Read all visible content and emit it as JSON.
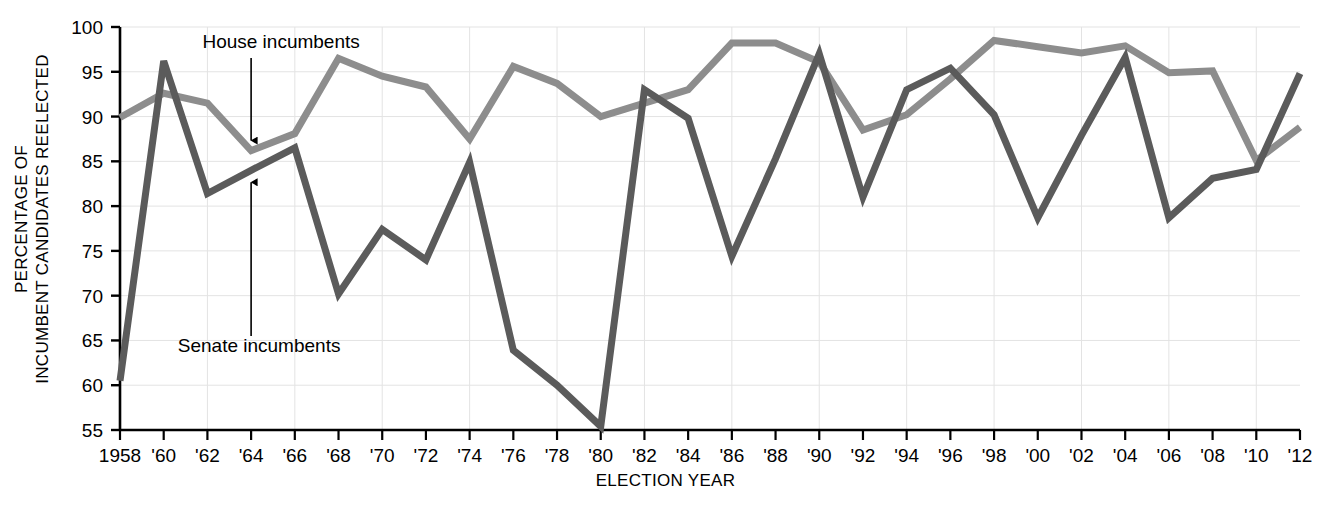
{
  "chart_data": {
    "type": "line",
    "title": "",
    "xlabel": "ELECTION YEAR",
    "ylabel": "PERCENTAGE OF\nINCUMBENT CANDIDATES REELECTED",
    "ylabel_line1": "PERCENTAGE OF",
    "ylabel_line2": "INCUMBENT CANDIDATES REELECTED",
    "xlim": [
      1958,
      2012
    ],
    "ylim": [
      55,
      100
    ],
    "yticks": [
      55,
      60,
      65,
      70,
      75,
      80,
      85,
      90,
      95,
      100
    ],
    "ytick_labels": [
      "55",
      "60",
      "65",
      "70",
      "75",
      "80",
      "85",
      "90",
      "95",
      "100"
    ],
    "grid": true,
    "grid_color": "#e3e3e3",
    "legend": "inline-annotations",
    "x": [
      1958,
      1960,
      1962,
      1964,
      1966,
      1968,
      1970,
      1972,
      1974,
      1976,
      1978,
      1980,
      1982,
      1984,
      1986,
      1988,
      1990,
      1992,
      1994,
      1996,
      1998,
      2000,
      2002,
      2004,
      2006,
      2008,
      2010,
      2012
    ],
    "xtick_labels": [
      "1958",
      "'60",
      "'62",
      "'64",
      "'66",
      "'68",
      "'70",
      "'72",
      "'74",
      "'76",
      "'78",
      "'80",
      "'82",
      "'84",
      "'86",
      "'88",
      "'90",
      "'92",
      "'94",
      "'96",
      "'98",
      "'00",
      "'02",
      "'04",
      "'06",
      "'08",
      "'10",
      "'12"
    ],
    "series": [
      {
        "name": "House incumbents",
        "color": "#8d8d8d",
        "values": [
          89.9,
          92.6,
          91.5,
          86.2,
          88.1,
          96.5,
          94.5,
          93.3,
          87.5,
          95.6,
          93.7,
          90.0,
          91.5,
          93.0,
          98.2,
          98.2,
          96.1,
          88.5,
          90.2,
          94.2,
          98.5,
          97.8,
          97.1,
          97.9,
          94.9,
          95.1,
          85.1,
          88.8
        ]
      },
      {
        "name": "Senate incumbents",
        "color": "#5b5b5b",
        "values": [
          60.5,
          96.2,
          81.4,
          84.0,
          86.5,
          70.2,
          77.4,
          74.0,
          84.9,
          63.9,
          60.0,
          55.4,
          93.0,
          89.8,
          74.4,
          85.3,
          97.0,
          81.0,
          93.0,
          95.4,
          90.2,
          78.7,
          87.9,
          96.6,
          78.7,
          83.1,
          84.1,
          94.8
        ]
      }
    ],
    "annotations": [
      {
        "text": "House incumbents",
        "target_series": "House incumbents",
        "target_x": 1964,
        "target_y": 86.2
      },
      {
        "text": "Senate incumbents",
        "target_series": "Senate incumbents",
        "target_x": 1964,
        "target_y": 84.0
      }
    ]
  }
}
